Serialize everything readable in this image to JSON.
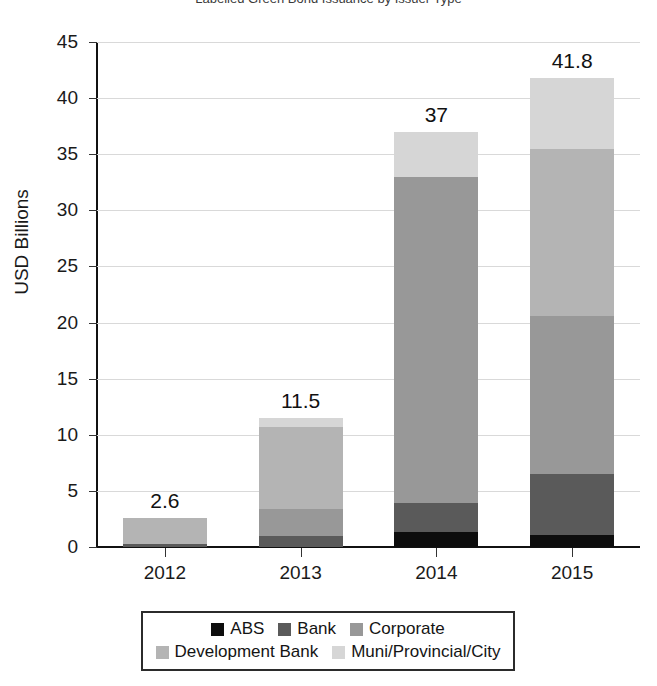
{
  "chart_title_clipped": "Labelled Green Bond Issuance by Issuer Type",
  "axis": {
    "ylabel": "USD Billions",
    "yticks": [
      "45",
      "40",
      "35",
      "30",
      "25",
      "20",
      "15",
      "10",
      "5",
      "0"
    ],
    "xticks": [
      "2012",
      "2013",
      "2014",
      "2015"
    ]
  },
  "legend": {
    "rows": [
      [
        {
          "label": "ABS",
          "color": "#0d0d0d"
        },
        {
          "label": "Bank",
          "color": "#5a5a5a"
        },
        {
          "label": "Corporate",
          "color": "#989898"
        }
      ],
      [
        {
          "label": "Development Bank",
          "color": "#b4b4b4"
        },
        {
          "label": "Muni/Provincial/City",
          "color": "#d6d6d6"
        }
      ]
    ]
  },
  "chart_data": {
    "type": "bar",
    "subtype": "stacked",
    "title": "Labelled Green Bond Issuance by Issuer Type",
    "xlabel": "",
    "ylabel": "USD Billions",
    "ylim": [
      0,
      45
    ],
    "ytick_step": 5,
    "grid": true,
    "legend_position": "bottom",
    "categories": [
      "2012",
      "2013",
      "2014",
      "2015"
    ],
    "series": [
      {
        "name": "ABS",
        "color": "#0d0d0d",
        "values": [
          0.0,
          0.0,
          1.3,
          1.1
        ]
      },
      {
        "name": "Bank",
        "color": "#5a5a5a",
        "values": [
          0.3,
          1.0,
          2.6,
          5.4
        ]
      },
      {
        "name": "Corporate",
        "color": "#989898",
        "values": [
          0.0,
          2.4,
          29.1,
          14.1
        ]
      },
      {
        "name": "Development Bank",
        "color": "#b4b4b4",
        "values": [
          2.3,
          7.3,
          0.0,
          14.9
        ]
      },
      {
        "name": "Muni/Provincial/City",
        "color": "#d6d6d6",
        "values": [
          0.0,
          0.8,
          4.0,
          6.3
        ]
      }
    ],
    "totals": [
      2.6,
      11.5,
      37,
      41.8
    ],
    "total_labels": [
      "2.6",
      "11.5",
      "37",
      "41.8"
    ]
  }
}
